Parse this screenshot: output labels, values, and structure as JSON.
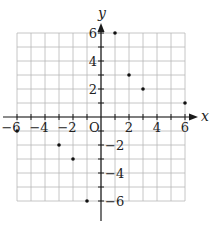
{
  "chart_data": {
    "type": "scatter",
    "title": "",
    "xlabel": "x",
    "ylabel": "y",
    "origin_label": "O",
    "xlim": [
      -6,
      6
    ],
    "ylim": [
      -6,
      6
    ],
    "grid": true,
    "x_ticks": [
      -6,
      -4,
      -2,
      2,
      4,
      6
    ],
    "y_ticks": [
      6,
      4,
      2,
      -2,
      -4,
      -6
    ],
    "x_tick_labels": [
      "−6",
      "−4",
      "−2",
      "2",
      "4",
      "6"
    ],
    "y_tick_labels": [
      "6",
      "4",
      "2",
      "−2",
      "−4",
      "−6"
    ],
    "points": [
      {
        "x": 1,
        "y": 6
      },
      {
        "x": 2,
        "y": 3
      },
      {
        "x": 3,
        "y": 2
      },
      {
        "x": 6,
        "y": 1
      },
      {
        "x": -6,
        "y": -1
      },
      {
        "x": -3,
        "y": -2
      },
      {
        "x": -2,
        "y": -3
      },
      {
        "x": -1,
        "y": -6
      }
    ],
    "colors": {
      "grid": "#b8b8b8",
      "axis": "#1a1a1a",
      "point": "#111111"
    }
  }
}
